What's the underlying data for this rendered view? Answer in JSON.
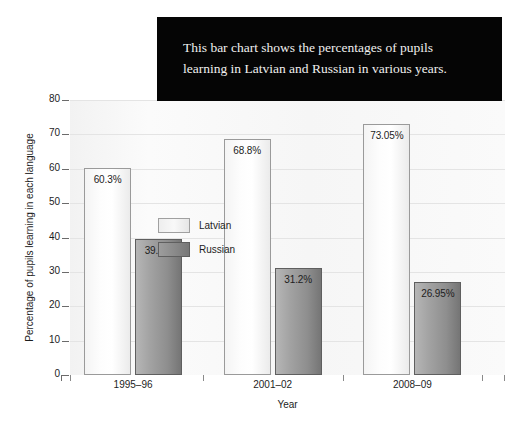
{
  "caption": {
    "text": "This bar chart shows the percentages of pupils learning in Latvian and Russian in various years.",
    "background_color": "#050505",
    "text_color": "#f0f0ef"
  },
  "legend": {
    "position": "top-left-inside-plot",
    "entries": [
      {
        "label": "Latvian",
        "color": "#f4f4f4"
      },
      {
        "label": "Russian",
        "color": "#8e8e8e"
      }
    ]
  },
  "axes": {
    "y_title": "Percentage of pupils learning in each language",
    "x_title": "Year",
    "y_ticks": [
      "80",
      "70",
      "60",
      "50",
      "40",
      "30",
      "20",
      "10",
      "0"
    ]
  },
  "chart_data": {
    "type": "bar",
    "title": "",
    "subtitle": "",
    "xlabel": "Year",
    "ylabel": "Percentage of pupils learning in each language",
    "categories": [
      "1995–96",
      "2001–02",
      "2008–09"
    ],
    "series": [
      {
        "name": "Latvian",
        "color": "#f4f4f4",
        "values": [
          60.3,
          68.8,
          73.05
        ],
        "labels": [
          "60.3%",
          "68.8%",
          "73.05%"
        ]
      },
      {
        "name": "Russian",
        "color": "#8e8e8e",
        "values": [
          39.7,
          31.2,
          26.95
        ],
        "labels": [
          "39.7%",
          "31.2%",
          "26.95%"
        ]
      }
    ],
    "ylim": [
      0,
      80
    ],
    "ytick_step": 10,
    "grid": true,
    "grid_axis": "y",
    "legend_position": "upper left",
    "bar_value_label_position": "inside-top"
  }
}
